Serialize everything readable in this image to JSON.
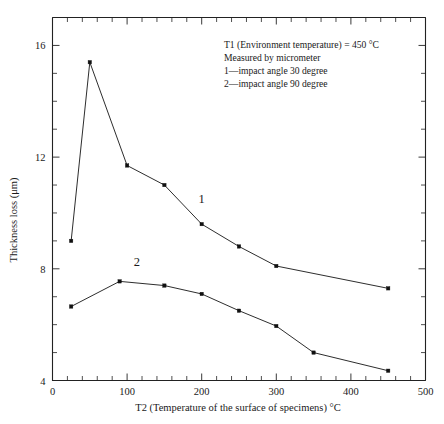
{
  "chart_data": {
    "type": "line",
    "title": "",
    "xlabel": "T2 (Temperature of the surface of specimens) °C",
    "ylabel": "Thickness loss (μm)",
    "xlim": [
      0,
      500
    ],
    "ylim": [
      4,
      17
    ],
    "xticks": [
      0,
      100,
      200,
      300,
      400,
      500
    ],
    "xtick_labels": [
      "0",
      "100",
      "200",
      "300",
      "400",
      "500"
    ],
    "x_minor_step": 20,
    "yticks": [
      4,
      8,
      12,
      16
    ],
    "ytick_labels": [
      "4",
      "8",
      "12",
      "16"
    ],
    "y_minor_step": 1,
    "grid": false,
    "legend_position": "inline-labels",
    "series": [
      {
        "name": "1",
        "label": "1—impact angle 30 degree",
        "marker": "square",
        "x": [
          25,
          50,
          100,
          150,
          200,
          250,
          300,
          450
        ],
        "values": [
          9.0,
          15.4,
          11.7,
          11.0,
          9.6,
          8.8,
          8.1,
          7.3
        ],
        "label_position": {
          "x": 200,
          "y": 10.35
        }
      },
      {
        "name": "2",
        "label": "2—impact angle 90 degree",
        "marker": "square",
        "x": [
          25,
          90,
          150,
          200,
          250,
          300,
          350,
          450
        ],
        "values": [
          6.65,
          7.55,
          7.4,
          7.1,
          6.5,
          5.95,
          5.0,
          4.35
        ],
        "label_position": {
          "x": 113,
          "y": 8.1
        }
      }
    ],
    "annotations": [
      "T1 (Environment temperature)  = 450 °C",
      "Measured by micrometer",
      "1—impact angle 30 degree",
      "2—impact angle 90 degree"
    ]
  },
  "colors": {
    "axis": "#222222",
    "line": "#222222",
    "marker": "#111111",
    "background": "#ffffff",
    "text": "#1a1a1a"
  }
}
